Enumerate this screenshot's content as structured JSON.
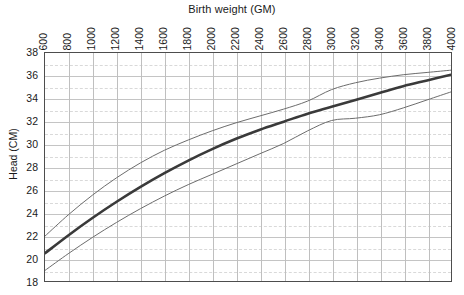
{
  "chart_data": {
    "type": "line",
    "title": "Birth weight (GM)",
    "xlabel": "Birth weight (GM)",
    "ylabel": "Head (CM)",
    "xlim": [
      600,
      4000
    ],
    "ylim": [
      18,
      38
    ],
    "xticks": [
      600,
      800,
      1000,
      1200,
      1400,
      1600,
      1800,
      2000,
      2200,
      2400,
      2600,
      2800,
      3000,
      3200,
      3400,
      3600,
      3800,
      4000
    ],
    "yticks": [
      18,
      20,
      22,
      24,
      26,
      28,
      30,
      32,
      34,
      36,
      38
    ],
    "grid": true,
    "minor_grid": true,
    "legend": "none",
    "x": [
      600,
      800,
      1000,
      1200,
      1400,
      1600,
      1800,
      2000,
      2200,
      2400,
      2600,
      2800,
      3000,
      3200,
      3400,
      3600,
      3800,
      4000
    ],
    "series": [
      {
        "name": "upper",
        "color": "#6b6b6b",
        "width": 1.0,
        "values": [
          22.0,
          23.9,
          25.6,
          27.1,
          28.4,
          29.5,
          30.4,
          31.2,
          31.9,
          32.5,
          33.1,
          33.8,
          34.8,
          35.4,
          35.8,
          36.1,
          36.3,
          36.5
        ]
      },
      {
        "name": "mean",
        "color": "#3a3a3a",
        "width": 2.6,
        "values": [
          20.5,
          22.1,
          23.6,
          25.0,
          26.3,
          27.5,
          28.6,
          29.6,
          30.5,
          31.3,
          32.0,
          32.7,
          33.3,
          33.9,
          34.5,
          35.1,
          35.6,
          36.1
        ]
      },
      {
        "name": "lower",
        "color": "#6b6b6b",
        "width": 1.0,
        "values": [
          19.0,
          20.5,
          21.9,
          23.2,
          24.4,
          25.5,
          26.5,
          27.4,
          28.3,
          29.2,
          30.1,
          31.2,
          32.1,
          32.3,
          32.6,
          33.2,
          33.9,
          34.6
        ]
      }
    ]
  },
  "axes": {
    "x_tick_labels": [
      "600",
      "800",
      "1000",
      "1200",
      "1400",
      "1600",
      "1800",
      "2000",
      "2200",
      "2400",
      "2600",
      "2800",
      "3000",
      "3200",
      "3400",
      "3600",
      "3800",
      "4000"
    ],
    "y_tick_labels": [
      "18",
      "20",
      "22",
      "24",
      "26",
      "28",
      "30",
      "32",
      "34",
      "36",
      "38"
    ]
  },
  "colors": {
    "axis": "#4d4d4d",
    "grid_major": "#bfbfbf",
    "grid_minor": "#d9d9d9",
    "background": "#ffffff",
    "mean_line": "#3a3a3a",
    "band_line": "#6b6b6b"
  }
}
